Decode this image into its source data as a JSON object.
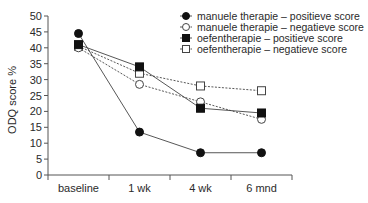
{
  "chart_data": {
    "type": "line",
    "title": "",
    "xlabel": "",
    "ylabel": "ODQ score %",
    "ylim": [
      0,
      50
    ],
    "yticks": [
      0,
      5,
      10,
      15,
      20,
      25,
      30,
      35,
      40,
      45,
      50
    ],
    "grid": false,
    "legend_position": "top-right",
    "categories": [
      "baseline",
      "1 wk",
      "4 wk",
      "6 mnd"
    ],
    "series": [
      {
        "name": "manuele therapie – positieve score",
        "marker": "filled-circle",
        "line": "solid",
        "values": [
          44.5,
          13.5,
          7,
          7
        ]
      },
      {
        "name": "manuele therapie – negatieve score",
        "marker": "open-circle",
        "line": "dotted",
        "values": [
          40,
          28.5,
          23,
          17.5
        ]
      },
      {
        "name": "oefentherapie – positieve score",
        "marker": "filled-square",
        "line": "solid",
        "values": [
          41,
          34,
          21,
          19.5
        ]
      },
      {
        "name": "oefentherapie – negatieve score",
        "marker": "open-square",
        "line": "dotted",
        "values": [
          40.5,
          32,
          28,
          26.5
        ]
      }
    ]
  },
  "colors": {
    "axis": "#555555",
    "line": "#444444",
    "marker": "#111111",
    "text": "#2a2a2a"
  }
}
